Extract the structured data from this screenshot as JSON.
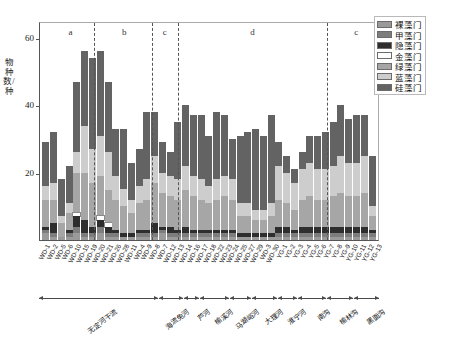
{
  "chart_data": {
    "type": "bar",
    "subtype": "stacked-bar",
    "title": "",
    "xlabel": "",
    "ylabel": "物种数/种",
    "ylim": [
      0,
      65
    ],
    "yticks": [
      20,
      40,
      60
    ],
    "grid": false,
    "legend_position": "top-right",
    "series": [
      {
        "name": "裸藻门",
        "color": "#9a9a9a",
        "values": [
          2,
          1,
          1,
          1,
          2,
          1,
          1,
          2,
          1,
          1,
          1,
          1,
          1,
          1,
          1,
          2,
          1,
          1,
          1,
          1,
          1,
          1,
          1,
          1,
          1,
          1,
          1,
          1,
          1,
          1,
          1,
          1,
          1,
          1,
          1,
          1,
          1,
          1,
          1,
          1,
          1,
          1,
          1
        ]
      },
      {
        "name": "甲藻门",
        "color": "#7d7d7d",
        "values": [
          1,
          1,
          0,
          1,
          2,
          1,
          1,
          2,
          1,
          1,
          0,
          0,
          1,
          1,
          1,
          1,
          1,
          1,
          1,
          1,
          1,
          1,
          1,
          1,
          1,
          0,
          0,
          0,
          0,
          0,
          1,
          1,
          1,
          1,
          1,
          1,
          1,
          1,
          1,
          1,
          1,
          1,
          1
        ]
      },
      {
        "name": "隐藻门",
        "color": "#2e2e2e",
        "values": [
          1,
          3,
          0,
          1,
          3,
          4,
          2,
          2,
          2,
          1,
          1,
          1,
          1,
          1,
          3,
          1,
          2,
          1,
          2,
          1,
          1,
          1,
          1,
          1,
          1,
          1,
          1,
          1,
          1,
          1,
          2,
          2,
          1,
          2,
          2,
          2,
          2,
          2,
          2,
          2,
          2,
          2,
          1
        ]
      },
      {
        "name": "金藻门",
        "color": "#ffffff",
        "values": [
          0,
          0,
          0,
          0,
          1,
          0,
          0,
          1,
          1,
          0,
          0,
          0,
          0,
          0,
          0,
          0,
          0,
          0,
          0,
          0,
          0,
          0,
          0,
          0,
          0,
          0,
          0,
          0,
          0,
          0,
          0,
          0,
          0,
          0,
          0,
          0,
          0,
          0,
          0,
          0,
          0,
          0,
          0
        ]
      },
      {
        "name": "绿藻门",
        "color": "#a6a6a6",
        "values": [
          8,
          7,
          4,
          5,
          12,
          14,
          13,
          12,
          10,
          9,
          8,
          6,
          8,
          9,
          12,
          10,
          9,
          9,
          11,
          10,
          9,
          8,
          9,
          10,
          9,
          5,
          5,
          4,
          4,
          5,
          8,
          7,
          6,
          8,
          9,
          8,
          8,
          9,
          10,
          9,
          9,
          10,
          4
        ]
      },
      {
        "name": "蓝藻门",
        "color": "#cdcdcd",
        "values": [
          4,
          5,
          2,
          3,
          6,
          14,
          10,
          12,
          11,
          7,
          5,
          4,
          5,
          6,
          8,
          6,
          6,
          6,
          7,
          6,
          6,
          5,
          6,
          6,
          6,
          4,
          4,
          3,
          3,
          4,
          10,
          9,
          8,
          9,
          10,
          9,
          9,
          9,
          11,
          10,
          10,
          11,
          3
        ]
      },
      {
        "name": "硅藻门",
        "color": "#636363",
        "values": [
          13,
          15,
          11,
          11,
          21,
          22,
          27,
          25,
          21,
          14,
          18,
          11,
          11,
          20,
          13,
          9,
          7,
          17,
          18,
          18,
          19,
          15,
          20,
          18,
          12,
          20,
          21,
          24,
          22,
          26,
          7,
          5,
          4,
          5,
          8,
          10,
          11,
          13,
          15,
          13,
          14,
          12,
          15
        ]
      }
    ],
    "categories": [
      "WD-1",
      "WD-2",
      "WD-5",
      "WD-6",
      "WD-10",
      "WD-15",
      "WD-19",
      "WD-20",
      "WD-21",
      "WD-26",
      "WD-28",
      "WD-11",
      "WD-4",
      "WD-9",
      "WD-8",
      "WD-7",
      "WD-12",
      "WD-13",
      "WD-14",
      "WD-16",
      "WD-17",
      "WD-18",
      "WD-22",
      "WD-23",
      "WD-24",
      "WD-25",
      "WD-27",
      "WD-29",
      "WD-3",
      "WD-30",
      "YG-1",
      "YG-2",
      "YG-3",
      "YG-4",
      "YG-5",
      "YG-6",
      "YG-7",
      "YG-8",
      "YG-9",
      "YG-10",
      "YG-11",
      "YG-12",
      "YG-13"
    ],
    "cluster_annotations": [
      {
        "label": "a",
        "x_frac": 0.09
      },
      {
        "label": "b",
        "x_frac": 0.248
      },
      {
        "label": "c",
        "x_frac": 0.367
      },
      {
        "label": "d",
        "x_frac": 0.625
      },
      {
        "label": "c",
        "x_frac": 0.93
      }
    ],
    "divider_fracs": [
      0.16,
      0.33,
      0.405,
      0.845
    ],
    "river_groups": [
      {
        "label": "无定河干流",
        "start_frac": 0.0,
        "end_frac": 0.35
      },
      {
        "label": "海流兔河",
        "start_frac": 0.352,
        "end_frac": 0.425
      },
      {
        "label": "芦河",
        "start_frac": 0.427,
        "end_frac": 0.472
      },
      {
        "label": "榆溪河",
        "start_frac": 0.474,
        "end_frac": 0.56
      },
      {
        "label": "马湖峪河",
        "start_frac": 0.562,
        "end_frac": 0.625
      },
      {
        "label": "大理河",
        "start_frac": 0.627,
        "end_frac": 0.7
      },
      {
        "label": "淮宁河",
        "start_frac": 0.702,
        "end_frac": 0.76
      },
      {
        "label": "南沟",
        "start_frac": 0.762,
        "end_frac": 0.845
      },
      {
        "label": "榆林沟",
        "start_frac": 0.847,
        "end_frac": 0.925
      },
      {
        "label": "黑面沟",
        "start_frac": 0.927,
        "end_frac": 1.0
      }
    ]
  },
  "axis": {
    "y_label": "物种数/种",
    "y_ticks": [
      "60",
      "40",
      "20",
      "0"
    ]
  }
}
